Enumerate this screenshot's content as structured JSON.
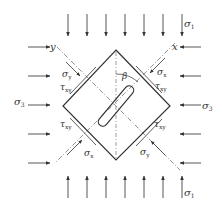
{
  "diagram": {
    "labels": {
      "sigma1_top": "σ",
      "sigma1_top_sub": "1",
      "sigma1_bottom": "σ",
      "sigma1_bottom_sub": "1",
      "sigma3_left": "σ",
      "sigma3_left_sub": "3",
      "sigma3_right": "σ",
      "sigma3_right_sub": "3",
      "axis_x": "x",
      "axis_y": "y",
      "beta": "β",
      "sigma_y_upper_left": "σ",
      "sigma_y_upper_left_sub": "y",
      "tau_xy_upper_left": "τ",
      "tau_xy_upper_left_sub": "xy",
      "sigma_x_upper_right": "σ",
      "sigma_x_upper_right_sub": "x",
      "tau_xy_upper_right": "τ",
      "tau_xy_upper_right_sub": "xy",
      "tau_xy_lower_left": "τ",
      "tau_xy_lower_left_sub": "xy",
      "sigma_x_lower_left": "σ",
      "sigma_x_lower_left_sub": "x",
      "tau_xy_lower_right": "τ",
      "tau_xy_lower_right_sub": "xy",
      "sigma_y_lower_right": "σ",
      "sigma_y_lower_right_sub": "y"
    },
    "load_arrows": {
      "top_count": 7,
      "bottom_count": 7,
      "left_count": 5,
      "right_count": 5
    },
    "colors": {
      "line": "#333333",
      "arrow": "#444444",
      "dash": "#777777"
    }
  }
}
